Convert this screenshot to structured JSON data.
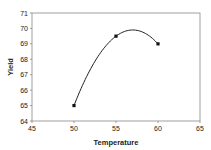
{
  "chart_data": {
    "type": "line",
    "title": "",
    "xlabel": "Temperature",
    "ylabel": "Yield",
    "xlim": [
      45,
      65
    ],
    "ylim": [
      64,
      71
    ],
    "x_ticks": [
      "45",
      "50",
      "55",
      "60",
      "65"
    ],
    "y_ticks": [
      "64",
      "65",
      "66",
      "67",
      "68",
      "69",
      "70",
      "71"
    ],
    "grid": false,
    "legend": null,
    "smooth": true,
    "series": [
      {
        "name": "Yield",
        "x": [
          50,
          55,
          60
        ],
        "values": [
          65,
          69.5,
          69
        ],
        "color": "#222222",
        "marker": "square"
      }
    ]
  }
}
